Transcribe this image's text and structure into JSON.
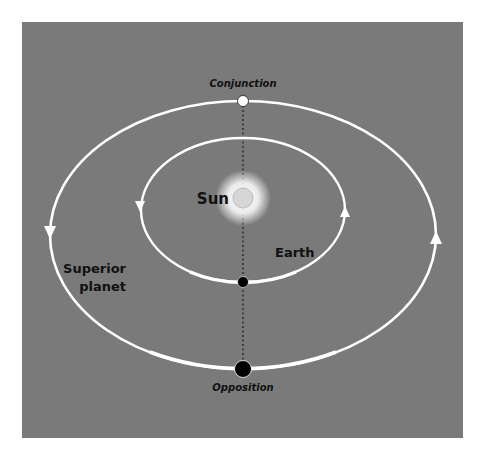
{
  "diagram": {
    "background_color": "#7a7a7a",
    "orbit_color": "#ffffff",
    "labels": {
      "conjunction": "Conjunction",
      "opposition": "Opposition",
      "sun": "Sun",
      "earth": "Earth",
      "superior_line1": "Superior",
      "superior_line2": "planet"
    },
    "orbits": {
      "inner": {
        "name": "Earth orbit",
        "cx": 243,
        "cy": 210,
        "rx": 102,
        "ry": 72,
        "direction": "counterclockwise"
      },
      "outer": {
        "name": "Superior planet orbit",
        "cx": 243,
        "cy": 235,
        "rx": 193,
        "ry": 134,
        "direction": "counterclockwise"
      }
    },
    "bodies": [
      {
        "name": "Sun",
        "x": 243,
        "y": 198,
        "color": "#d8d8d8"
      },
      {
        "name": "Superior planet at conjunction",
        "x": 243,
        "y": 101,
        "color": "#ffffff"
      },
      {
        "name": "Earth",
        "x": 243,
        "y": 282,
        "color": "#000000"
      },
      {
        "name": "Superior planet at opposition",
        "x": 243,
        "y": 369,
        "color": "#000000"
      }
    ],
    "alignment_line": "dotted vertical line through Conjunction, Sun, Earth, Opposition"
  }
}
